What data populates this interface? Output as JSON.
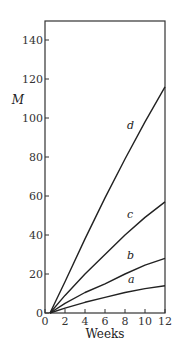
{
  "chart_data": {
    "type": "line",
    "title": "",
    "xlabel": "Weeks",
    "ylabel": "M",
    "xlim": [
      0,
      12
    ],
    "ylim": [
      0,
      150
    ],
    "xticks": [
      0,
      2,
      4,
      6,
      8,
      10,
      12
    ],
    "yticks": [
      0,
      20,
      40,
      60,
      80,
      100,
      120,
      140
    ],
    "grid": false,
    "legend": "inline labels on curves",
    "series": [
      {
        "name": "a",
        "x": [
          0.5,
          2,
          4,
          6,
          8,
          10,
          12
        ],
        "values": [
          0,
          2.5,
          5.5,
          8,
          10.5,
          12.5,
          14
        ]
      },
      {
        "name": "b",
        "x": [
          0.5,
          2,
          4,
          6,
          8,
          10,
          12
        ],
        "values": [
          0,
          5,
          10.5,
          15,
          20,
          24.5,
          28
        ]
      },
      {
        "name": "c",
        "x": [
          0.5,
          2,
          4,
          6,
          8,
          10,
          12
        ],
        "values": [
          0,
          9,
          20,
          30,
          40,
          49,
          57
        ]
      },
      {
        "name": "d",
        "x": [
          0.5,
          2,
          4,
          6,
          8,
          10,
          12
        ],
        "values": [
          0,
          16,
          38,
          59,
          79,
          98,
          116
        ]
      }
    ],
    "label_positions": {
      "a": {
        "x": 8.7,
        "y": 14
      },
      "b": {
        "x": 8.6,
        "y": 26
      },
      "c": {
        "x": 8.6,
        "y": 47
      },
      "d": {
        "x": 8.6,
        "y": 93
      }
    }
  }
}
